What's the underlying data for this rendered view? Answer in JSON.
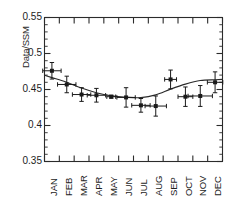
{
  "chart_data": {
    "type": "scatter",
    "title": "",
    "subtitle": "",
    "xlabel": "",
    "ylabel": "Data/SSM",
    "categories": [
      "JAN",
      "FEB",
      "MAR",
      "APR",
      "MAY",
      "JUN",
      "JUL",
      "AUG",
      "SEP",
      "OCT",
      "NOV",
      "DEC"
    ],
    "values": [
      0.476,
      0.457,
      0.443,
      0.442,
      0.44,
      0.439,
      0.428,
      0.427,
      0.464,
      0.44,
      0.441,
      0.46
    ],
    "y_err": [
      0.0115,
      0.0115,
      0.0095,
      0.0095,
      0.002,
      0.0135,
      0.0095,
      0.014,
      0.013,
      0.0135,
      0.0145,
      0.0145
    ],
    "x_err_half_months": [
      0.62,
      0.62,
      0.62,
      0.62,
      0.3,
      0.62,
      0.62,
      0.72,
      0.4,
      0.5,
      0.82,
      0.52
    ],
    "fit_curve": {
      "name": "sinusoidal fit",
      "x": [
        "JAN",
        "FEB",
        "MAR",
        "APR",
        "MAY",
        "JUN",
        "JUL",
        "AUG",
        "SEP",
        "OCT",
        "NOV",
        "DEC"
      ],
      "y": [
        0.4665,
        0.46,
        0.452,
        0.4455,
        0.4412,
        0.4392,
        0.4387,
        0.4425,
        0.4505,
        0.4575,
        0.4625,
        0.4635
      ]
    },
    "ylim": [
      0.35,
      0.55
    ],
    "yticks": [
      0.35,
      0.4,
      0.45,
      0.5,
      0.55
    ],
    "ytick_labels": [
      "0.35",
      "0.4",
      "0.45",
      "0.5",
      "0.55"
    ],
    "y_minor_tick_interval": 0.01,
    "grid": false,
    "legend": null,
    "marker": "filled-square",
    "marker_color": "#1a1a1a",
    "line_color": "#2b2b2b",
    "axis_color": "#2b2b2b"
  },
  "axis": {
    "ylabel": "Data/SSM",
    "yticks": [
      "0.55",
      "0.5",
      "0.45",
      "0.4",
      "0.35"
    ],
    "xticks": [
      "JAN",
      "FEB",
      "MAR",
      "APR",
      "MAY",
      "JUN",
      "JUL",
      "AUG",
      "SEP",
      "OCT",
      "NOV",
      "DEC"
    ]
  }
}
